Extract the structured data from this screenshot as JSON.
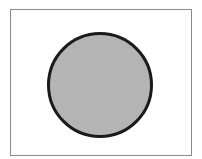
{
  "diagram": {
    "frame": {
      "x": 10.5,
      "y": 9.5,
      "width": 181,
      "height": 146,
      "stroke": "#8a8a8a",
      "fill": "#ffffff"
    },
    "circle": {
      "cx": 100,
      "cy": 85,
      "r": 51.5,
      "fill": "#b4b4b4",
      "stroke": "#1a1a1a",
      "stroke_width": 3
    }
  }
}
